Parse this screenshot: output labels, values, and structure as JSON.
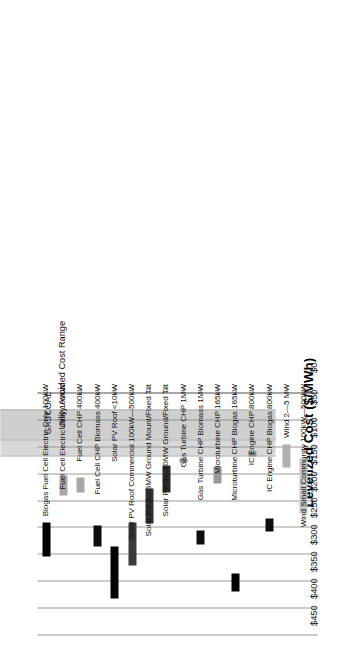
{
  "chart_data": {
    "type": "bar",
    "subtype": "floating-range-bar",
    "title": "",
    "xlabel": "",
    "ylabel": "Levelized Cost ($/MWh)",
    "ylim": [
      0,
      450
    ],
    "yticks": [
      0,
      50,
      100,
      150,
      200,
      250,
      300,
      350,
      400,
      450
    ],
    "ytick_labels": [
      "$0",
      "$50",
      "$100",
      "$150",
      "$200",
      "$250",
      "$300",
      "$350",
      "$400",
      "$450"
    ],
    "grid": true,
    "legend_position": "none",
    "orientation": "rotated-90",
    "categories": [
      "Biogas Fuel Cell Electric Only 100kW",
      "Fuel Cell Electric Only 100kW",
      "Fuel Cell CHP 400kW",
      "Fuel Cell CHP Biomass 400kW",
      "Solar PV Roof <10kW",
      "Solar PV Roof Commercial 100kW—500kW",
      "Solar PV 2—5MW Ground Mount/Fixed Tilt",
      "Solar PV 5—20MW Ground/Fixed Tilt",
      "Gas Turbine CHP 1MW",
      "Gas Turbine CHP Biomass 1MW",
      "Microturbine CHP 165kW",
      "Microturbine CHP Biogas 165kW",
      "IC Engine CHP 800kW",
      "IC Engine CHP Biogas 800kW",
      "Wind 2—5 MW",
      "Wind Small Community 100kW—500kW"
    ],
    "bars": [
      {
        "category": "Biogas Fuel Cell Electric Only 100kW",
        "low": 240,
        "high": 303,
        "color": "#000000"
      },
      {
        "category": "Fuel Cell Electric Only 100kW",
        "low": 153,
        "high": 190,
        "color": "#a8a8a8"
      },
      {
        "category": "Fuel Cell CHP 400kW",
        "low": 156,
        "high": 185,
        "color": "#a8a8a8"
      },
      {
        "category": "Fuel Cell CHP Biomass 400kW",
        "low": 245,
        "high": 284,
        "color": "#0d0d0d"
      },
      {
        "category": "Solar PV Roof <10kW",
        "low": 285,
        "high": 382,
        "color": "#000000"
      },
      {
        "category": "Solar PV Roof Commercial 100kW—500kW",
        "low": 240,
        "high": 320,
        "color": "#3a3a3a"
      },
      {
        "category": "Solar PV 2—5MW Ground Mount/Fixed Tilt",
        "low": 176,
        "high": 241,
        "color": "#2e2e2e"
      },
      {
        "category": "Solar PV 5—20MW Ground/Fixed Tilt",
        "low": 134,
        "high": 185,
        "color": "#2a2a2a"
      },
      {
        "category": "Gas Turbine CHP 1MW",
        "low": 120,
        "high": 128,
        "color": "#8f8f8f"
      },
      {
        "category": "Gas Turbine CHP Biomass 1MW",
        "low": 255,
        "high": 281,
        "color": "#0d0d0d"
      },
      {
        "category": "Microturbine CHP 165kW",
        "low": 135,
        "high": 167,
        "color": "#9a9a9a"
      },
      {
        "category": "Microturbine CHP Biogas 165kW",
        "low": 335,
        "high": 368,
        "color": "#000000"
      },
      {
        "category": "IC Engine CHP 800kW",
        "low": 108,
        "high": 118,
        "color": "#8f8f8f"
      },
      {
        "category": "IC Engine CHP Biogas 800kW",
        "low": 233,
        "high": 256,
        "color": "#0d0d0d"
      },
      {
        "category": "Wind 2—5 MW",
        "low": 95,
        "high": 137,
        "color": "#b0b0b0"
      },
      {
        "category": "Wind Small Community 100kW—500kW",
        "low": 120,
        "high": 224,
        "color": "#c4c4c4"
      }
    ],
    "bands": [
      {
        "label": "GAS",
        "low": 30,
        "high": 118,
        "color": "#d8d8d8"
      },
      {
        "label": "COAL",
        "low": 30,
        "high": 88,
        "color": "#cfcfcf"
      }
    ],
    "band_group_label": "Utility Avoided Cost Range"
  }
}
